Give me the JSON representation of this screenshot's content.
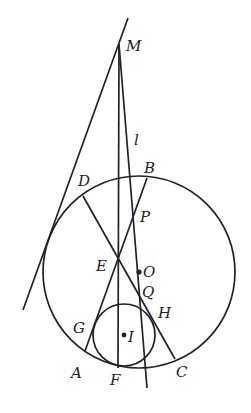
{
  "diagram": {
    "type": "geometry",
    "colors": {
      "ink": "#222222",
      "background": "#ffffff"
    },
    "points": {
      "M": {
        "label": "M",
        "x": 119,
        "y": 44
      },
      "l": {
        "label": "l",
        "x": 137,
        "y": 143
      },
      "B": {
        "label": "B",
        "x": 147,
        "y": 178
      },
      "D": {
        "label": "D",
        "x": 83,
        "y": 196
      },
      "P": {
        "label": "P",
        "x": 134,
        "y": 216
      },
      "E": {
        "label": "E",
        "x": 118,
        "y": 258
      },
      "O": {
        "label": "O",
        "x": 139,
        "y": 272
      },
      "Q": {
        "label": "Q",
        "x": 145,
        "y": 297
      },
      "H": {
        "label": "H",
        "x": 172,
        "y": 316
      },
      "G": {
        "label": "G",
        "x": 100,
        "y": 330
      },
      "I": {
        "label": "I",
        "x": 124,
        "y": 335
      },
      "A": {
        "label": "A",
        "x": 85,
        "y": 351
      },
      "F": {
        "label": "F",
        "x": 118,
        "y": 368
      },
      "C": {
        "label": "C",
        "x": 175,
        "y": 359
      }
    },
    "circles": [
      {
        "name": "circumcircle",
        "center": "O",
        "radius": 96
      },
      {
        "name": "incircle",
        "center": "I",
        "radius": 31
      }
    ],
    "segments": [
      {
        "name": "tangent-line-through-M",
        "from": [
          128,
          18
        ],
        "to": [
          23,
          310
        ]
      },
      {
        "name": "line-MF",
        "from": "M",
        "to": "F"
      },
      {
        "name": "line-l",
        "from": "M",
        "to": [
          147,
          388
        ]
      },
      {
        "name": "segment-DC",
        "from": "D",
        "to": "C"
      },
      {
        "name": "segment-BA",
        "from": "B",
        "to": "A"
      }
    ]
  }
}
